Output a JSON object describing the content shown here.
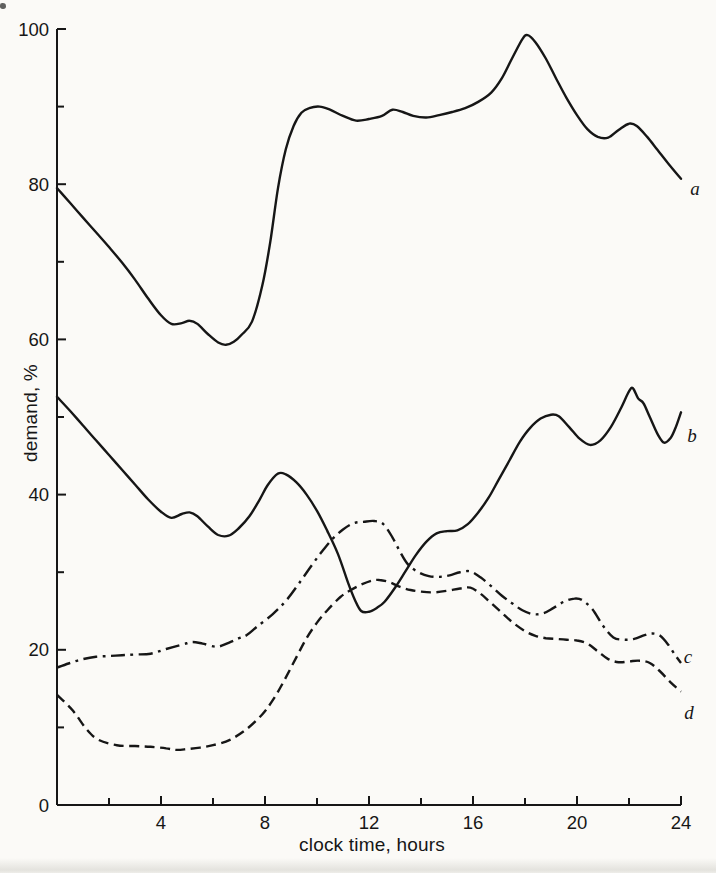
{
  "figure": {
    "background": "#fbfaf7",
    "ink": "#161616"
  },
  "chart_data": {
    "type": "line",
    "title": "",
    "xlabel": "clock time, hours",
    "ylabel": "demand, %",
    "xlim": [
      0,
      24
    ],
    "ylim": [
      0,
      100
    ],
    "grid": false,
    "legend_position": "curve-end-labels",
    "x_major_ticks": [
      4,
      8,
      12,
      16,
      20,
      24
    ],
    "x_minor_ticks": [
      2,
      6,
      10,
      14,
      18,
      22
    ],
    "y_major_ticks": [
      0,
      20,
      40,
      60,
      80,
      100
    ],
    "y_minor_ticks": [
      10,
      30,
      50,
      70,
      90
    ],
    "series": [
      {
        "name": "a",
        "label": "a",
        "line_style": "solid",
        "points": [
          [
            0,
            79.5
          ],
          [
            0.5,
            77.6
          ],
          [
            1,
            75.7
          ],
          [
            1.5,
            73.8
          ],
          [
            2,
            71.9
          ],
          [
            2.5,
            69.9
          ],
          [
            3,
            67.7
          ],
          [
            3.5,
            65.3
          ],
          [
            4,
            63.1
          ],
          [
            4.4,
            62
          ],
          [
            4.8,
            62.1
          ],
          [
            5.1,
            62.4
          ],
          [
            5.4,
            62
          ],
          [
            5.8,
            60.7
          ],
          [
            6.2,
            59.6
          ],
          [
            6.5,
            59.3
          ],
          [
            6.8,
            59.7
          ],
          [
            7.1,
            60.6
          ],
          [
            7.5,
            62.3
          ],
          [
            7.9,
            67
          ],
          [
            8.2,
            72.5
          ],
          [
            8.5,
            79.5
          ],
          [
            8.8,
            84.5
          ],
          [
            9.1,
            87.5
          ],
          [
            9.4,
            89.2
          ],
          [
            9.7,
            89.8
          ],
          [
            10.1,
            90
          ],
          [
            10.5,
            89.6
          ],
          [
            11,
            88.8
          ],
          [
            11.5,
            88.2
          ],
          [
            12,
            88.4
          ],
          [
            12.5,
            88.8
          ],
          [
            12.9,
            89.6
          ],
          [
            13.3,
            89.3
          ],
          [
            13.7,
            88.8
          ],
          [
            14.2,
            88.6
          ],
          [
            14.7,
            88.9
          ],
          [
            15.2,
            89.3
          ],
          [
            15.7,
            89.8
          ],
          [
            16.2,
            90.6
          ],
          [
            16.7,
            91.8
          ],
          [
            17.1,
            93.6
          ],
          [
            17.5,
            96.2
          ],
          [
            17.9,
            98.7
          ],
          [
            18.1,
            99.2
          ],
          [
            18.4,
            98.3
          ],
          [
            18.8,
            96.2
          ],
          [
            19.2,
            93.6
          ],
          [
            19.6,
            91.1
          ],
          [
            20,
            88.9
          ],
          [
            20.4,
            87.1
          ],
          [
            20.8,
            86.1
          ],
          [
            21.2,
            86
          ],
          [
            21.6,
            87
          ],
          [
            22,
            87.8
          ],
          [
            22.3,
            87.5
          ],
          [
            22.7,
            86.1
          ],
          [
            23.1,
            84.4
          ],
          [
            23.5,
            82.7
          ],
          [
            24,
            80.7
          ]
        ]
      },
      {
        "name": "b",
        "label": "b",
        "line_style": "solid",
        "points": [
          [
            0,
            52.6
          ],
          [
            0.5,
            50.8
          ],
          [
            1,
            48.9
          ],
          [
            1.5,
            47
          ],
          [
            2,
            45.1
          ],
          [
            2.5,
            43.2
          ],
          [
            3,
            41.3
          ],
          [
            3.5,
            39.4
          ],
          [
            4,
            37.8
          ],
          [
            4.4,
            37
          ],
          [
            4.8,
            37.5
          ],
          [
            5.1,
            37.7
          ],
          [
            5.4,
            37.2
          ],
          [
            5.8,
            35.9
          ],
          [
            6.2,
            34.8
          ],
          [
            6.6,
            34.7
          ],
          [
            7,
            35.7
          ],
          [
            7.4,
            37.2
          ],
          [
            7.8,
            39.4
          ],
          [
            8.1,
            41.2
          ],
          [
            8.5,
            42.7
          ],
          [
            8.8,
            42.6
          ],
          [
            9.2,
            41.6
          ],
          [
            9.6,
            40
          ],
          [
            10,
            37.9
          ],
          [
            10.4,
            35.3
          ],
          [
            10.8,
            32.4
          ],
          [
            11.2,
            28.6
          ],
          [
            11.45,
            26.5
          ],
          [
            11.7,
            25
          ],
          [
            12,
            24.9
          ],
          [
            12.3,
            25.4
          ],
          [
            12.6,
            26.2
          ],
          [
            13,
            28
          ],
          [
            13.4,
            30.1
          ],
          [
            13.8,
            32.2
          ],
          [
            14.2,
            33.9
          ],
          [
            14.6,
            35
          ],
          [
            15,
            35.3
          ],
          [
            15.4,
            35.4
          ],
          [
            15.8,
            36.2
          ],
          [
            16.2,
            37.7
          ],
          [
            16.6,
            39.6
          ],
          [
            17,
            42
          ],
          [
            17.4,
            44.4
          ],
          [
            17.8,
            46.8
          ],
          [
            18.2,
            48.6
          ],
          [
            18.6,
            49.8
          ],
          [
            19,
            50.3
          ],
          [
            19.3,
            50.1
          ],
          [
            19.7,
            48.7
          ],
          [
            20.1,
            47.2
          ],
          [
            20.5,
            46.4
          ],
          [
            20.9,
            47
          ],
          [
            21.3,
            48.7
          ],
          [
            21.7,
            51.2
          ],
          [
            22,
            53.3
          ],
          [
            22.15,
            53.7
          ],
          [
            22.35,
            52.4
          ],
          [
            22.55,
            51.8
          ],
          [
            22.8,
            50
          ],
          [
            23.1,
            47.8
          ],
          [
            23.35,
            46.7
          ],
          [
            23.6,
            47.3
          ],
          [
            23.8,
            48.7
          ],
          [
            24,
            50.6
          ]
        ]
      },
      {
        "name": "c",
        "label": "c",
        "line_style": "dash-dot",
        "points": [
          [
            0,
            17.7
          ],
          [
            0.5,
            18.3
          ],
          [
            1,
            18.8
          ],
          [
            1.5,
            19.1
          ],
          [
            2,
            19.2
          ],
          [
            2.5,
            19.3
          ],
          [
            3,
            19.4
          ],
          [
            3.6,
            19.5
          ],
          [
            4.2,
            20.1
          ],
          [
            4.85,
            20.7
          ],
          [
            5.2,
            21
          ],
          [
            5.6,
            20.8
          ],
          [
            6.15,
            20.4
          ],
          [
            6.6,
            20.9
          ],
          [
            7,
            21.5
          ],
          [
            7.3,
            21.9
          ],
          [
            7.7,
            23
          ],
          [
            8.3,
            24.6
          ],
          [
            8.85,
            26.5
          ],
          [
            9.4,
            29
          ],
          [
            9.8,
            30.9
          ],
          [
            10.2,
            32.7
          ],
          [
            10.6,
            34.3
          ],
          [
            11,
            35.5
          ],
          [
            11.4,
            36.3
          ],
          [
            11.8,
            36.5
          ],
          [
            12.2,
            36.6
          ],
          [
            12.55,
            36.2
          ],
          [
            12.9,
            34.5
          ],
          [
            13.2,
            32.6
          ],
          [
            13.5,
            31
          ],
          [
            13.9,
            30
          ],
          [
            14.3,
            29.5
          ],
          [
            14.7,
            29.4
          ],
          [
            15.1,
            29.6
          ],
          [
            15.5,
            30
          ],
          [
            15.9,
            30.1
          ],
          [
            16.3,
            29.3
          ],
          [
            16.7,
            28.2
          ],
          [
            17.1,
            27
          ],
          [
            17.5,
            26
          ],
          [
            17.9,
            25.1
          ],
          [
            18.3,
            24.6
          ],
          [
            18.7,
            24.7
          ],
          [
            19.1,
            25.4
          ],
          [
            19.5,
            26.2
          ],
          [
            19.9,
            26.6
          ],
          [
            20.2,
            26.4
          ],
          [
            20.6,
            25.2
          ],
          [
            21,
            23.1
          ],
          [
            21.4,
            21.6
          ],
          [
            21.8,
            21.3
          ],
          [
            22.2,
            21.4
          ],
          [
            22.6,
            21.9
          ],
          [
            22.9,
            22.1
          ],
          [
            23.2,
            21.8
          ],
          [
            23.5,
            20.7
          ],
          [
            23.8,
            19.2
          ],
          [
            24,
            18.3
          ]
        ]
      },
      {
        "name": "d",
        "label": "d",
        "line_style": "dashed",
        "points": [
          [
            0,
            14.2
          ],
          [
            0.6,
            12.2
          ],
          [
            1.15,
            9.7
          ],
          [
            1.6,
            8.4
          ],
          [
            2.3,
            7.7
          ],
          [
            3,
            7.6
          ],
          [
            3.6,
            7.5
          ],
          [
            4.2,
            7.3
          ],
          [
            4.6,
            7.1
          ],
          [
            5,
            7.2
          ],
          [
            5.5,
            7.4
          ],
          [
            6,
            7.7
          ],
          [
            6.65,
            8.4
          ],
          [
            7.3,
            9.8
          ],
          [
            7.9,
            11.7
          ],
          [
            8.3,
            13.5
          ],
          [
            8.7,
            15.8
          ],
          [
            9.2,
            19
          ],
          [
            9.6,
            21.5
          ],
          [
            10,
            23.5
          ],
          [
            10.4,
            25.1
          ],
          [
            10.9,
            26.8
          ],
          [
            11.3,
            27.7
          ],
          [
            11.7,
            28.4
          ],
          [
            12.1,
            28.9
          ],
          [
            12.4,
            29
          ],
          [
            12.8,
            28.7
          ],
          [
            13.2,
            28.1
          ],
          [
            13.6,
            27.7
          ],
          [
            14,
            27.5
          ],
          [
            14.5,
            27.4
          ],
          [
            15,
            27.6
          ],
          [
            15.5,
            27.9
          ],
          [
            15.9,
            28
          ],
          [
            16.3,
            27.2
          ],
          [
            16.7,
            26
          ],
          [
            17.1,
            24.8
          ],
          [
            17.5,
            23.6
          ],
          [
            18,
            22.4
          ],
          [
            18.4,
            21.8
          ],
          [
            18.8,
            21.5
          ],
          [
            19.2,
            21.4
          ],
          [
            19.6,
            21.3
          ],
          [
            20,
            21.2
          ],
          [
            20.4,
            20.8
          ],
          [
            20.8,
            19.8
          ],
          [
            21.2,
            18.8
          ],
          [
            21.6,
            18.4
          ],
          [
            22,
            18.5
          ],
          [
            22.4,
            18.6
          ],
          [
            22.8,
            18.3
          ],
          [
            23.2,
            17.2
          ],
          [
            23.6,
            15.8
          ],
          [
            24,
            14.6
          ]
        ]
      }
    ]
  }
}
